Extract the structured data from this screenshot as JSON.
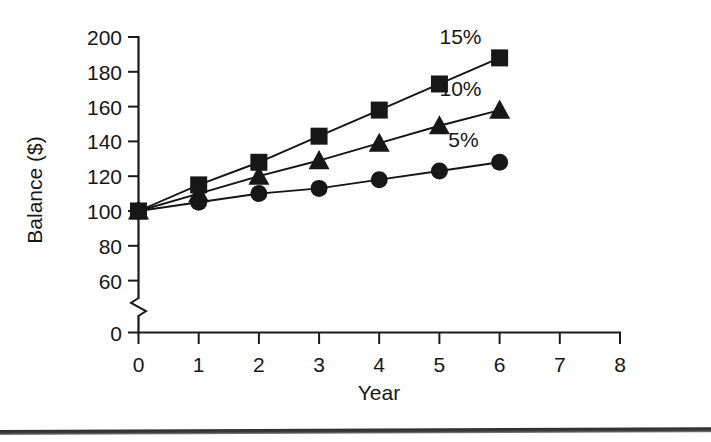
{
  "figure": {
    "background_color": "#ffffff",
    "ink_color": "#161616",
    "y_axis_title": "Balance ($)",
    "x_axis_title": "Year",
    "has_axis_break": true,
    "axis_break_note": "y-axis break between 60 and 0"
  },
  "chart_data": {
    "type": "line",
    "title": "",
    "xlabel": "Year",
    "ylabel": "Balance ($)",
    "x": [
      0,
      1,
      2,
      3,
      4,
      5,
      6
    ],
    "xlim": [
      0,
      8
    ],
    "ylim": [
      0,
      200
    ],
    "y_break": [
      0,
      60
    ],
    "xticks": [
      0,
      1,
      2,
      3,
      4,
      5,
      6,
      7,
      8
    ],
    "xticklabels": [
      "0",
      "1",
      "2",
      "3",
      "4",
      "5",
      "6",
      "7",
      "8"
    ],
    "yticks": [
      0,
      60,
      80,
      100,
      120,
      140,
      160,
      180,
      200
    ],
    "yticklabels": [
      "0",
      "60",
      "80",
      "100",
      "120",
      "140",
      "160",
      "180",
      "200"
    ],
    "grid": false,
    "legend": "inline-end-labels",
    "series": [
      {
        "name": "15%",
        "label": "15%",
        "marker": "square",
        "values": [
          100,
          115,
          128,
          143,
          158,
          173,
          188
        ],
        "label_x": 5.35,
        "label_y": 196
      },
      {
        "name": "10%",
        "label": "10%",
        "marker": "triangle",
        "values": [
          100,
          110,
          120,
          129,
          139,
          149,
          158
        ],
        "label_x": 5.35,
        "label_y": 166
      },
      {
        "name": "5%",
        "label": "5%",
        "marker": "circle",
        "values": [
          100,
          105,
          110,
          113,
          118,
          123,
          128
        ],
        "label_x": 5.4,
        "label_y": 137
      }
    ]
  }
}
